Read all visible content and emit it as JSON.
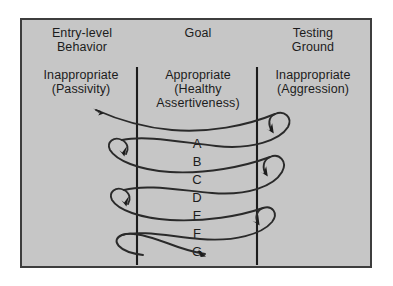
{
  "diagram": {
    "background_color": "#c6c6c6",
    "frame_color": "#3d3d3d",
    "line_color": "#2a2a2a",
    "text_color": "#1c1c1c",
    "columns": [
      {
        "id": "entry-level-behavior",
        "heading": "Entry-level\nBehavior",
        "subheading": "Inappropriate\n(Passivity)"
      },
      {
        "id": "goal",
        "heading": "Goal",
        "subheading": "Appropriate\n(Healthy\nAssertiveness)"
      },
      {
        "id": "testing-ground",
        "heading": "Testing\nGround",
        "subheading": "Inappropriate\n(Aggression)"
      }
    ],
    "row_labels": [
      "A",
      "B",
      "C",
      "D",
      "E",
      "F",
      "G"
    ],
    "dividers": 2,
    "arrowheads": 7
  }
}
